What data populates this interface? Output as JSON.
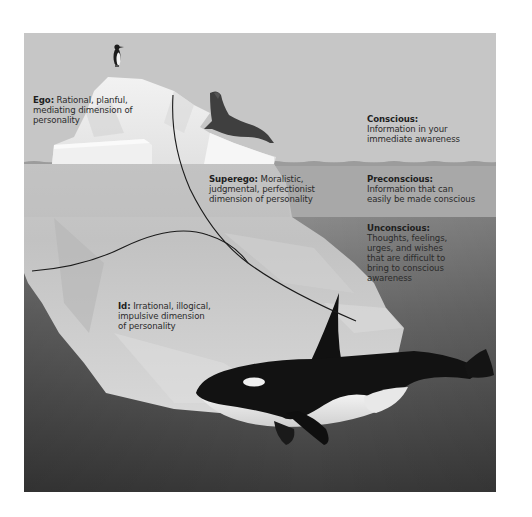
{
  "diagram": {
    "type": "iceberg-model-of-mind",
    "colors": {
      "sky": "#c8c8c8",
      "conscious_band": "#c4c4c4",
      "preconscious_band": "#a9a9a9",
      "unconscious_band_top": "#8e8e8e",
      "unconscious_band_bottom": "#3a3a3a",
      "iceberg": "#e6e6e6",
      "whale": "#161616",
      "leader_line": "#1a1a1a"
    },
    "structures": {
      "ego": {
        "term": "Ego:",
        "lines": [
          "Rational, planful,",
          "mediating dimension of",
          "personality"
        ]
      },
      "superego": {
        "term": "Superego:",
        "lines": [
          "Moralistic,",
          "judgmental, perfectionist",
          "dimension of personality"
        ]
      },
      "id": {
        "term": "Id:",
        "lines": [
          "Irrational, illogical,",
          "impulsive dimension",
          "of personality"
        ]
      }
    },
    "levels": {
      "conscious": {
        "term": "Conscious:",
        "lines": [
          "Information in your",
          "immediate awareness"
        ]
      },
      "preconscious": {
        "term": "Preconscious:",
        "lines": [
          "Information that can",
          "easily be made conscious"
        ]
      },
      "unconscious": {
        "term": "Unconscious:",
        "lines": [
          "Thoughts, feelings,",
          "urges, and wishes",
          "that are difficult to",
          "bring to conscious",
          "awareness"
        ]
      }
    },
    "illustrations": [
      "penguin",
      "seal",
      "orca",
      "iceberg"
    ]
  }
}
